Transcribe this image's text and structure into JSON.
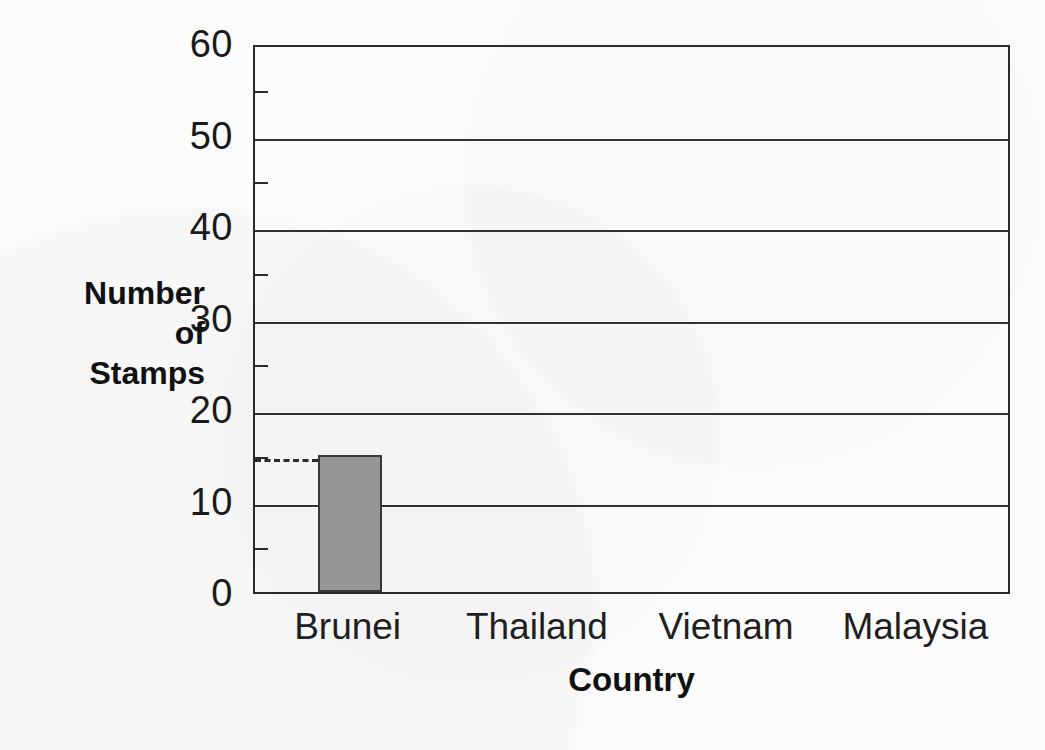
{
  "chart_data": {
    "type": "bar",
    "title": "",
    "categories": [
      "Brunei",
      "Thailand",
      "Vietnam",
      "Malaysia"
    ],
    "values": [
      15,
      0,
      0,
      0
    ],
    "xlabel": "Country",
    "ylabel": "Number of Stamps",
    "ylabel_lines": [
      "Number",
      "of",
      "Stamps"
    ],
    "ylim": [
      0,
      60
    ],
    "y_major_ticks": [
      0,
      10,
      20,
      30,
      40,
      50,
      60
    ],
    "y_minor_ticks": [
      5,
      15,
      25,
      35,
      45,
      55
    ],
    "y_tick_labels": [
      "0",
      "10",
      "20",
      "30",
      "40",
      "50",
      "60"
    ],
    "grid": "horizontal-major",
    "legend": "none",
    "annotations": [
      {
        "type": "dashed-guide-line",
        "value": 15,
        "label": "",
        "from": "y-axis",
        "to": "brunei-bar"
      }
    ],
    "bar_color": "#9a9a9a",
    "bar_border_color": "#3a3a3a",
    "axis_color": "#2b2b2b",
    "background_color": "#fbfbfb"
  }
}
